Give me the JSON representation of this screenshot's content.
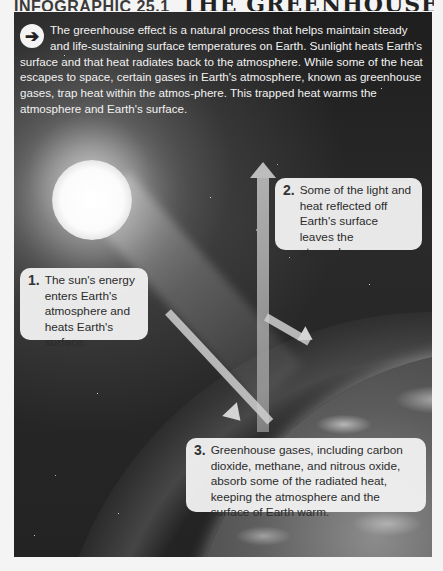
{
  "heading": {
    "label": "INFOGRAPHIC 25.1",
    "title": "THE GREENHOUSE EFFECT"
  },
  "intro": {
    "icon": "arrow-right-circle-icon",
    "text": "The greenhouse effect is a natural process that helps maintain steady and life-sustaining surface temperatures on Earth. Sunlight heats Earth's surface and that heat radiates back to the atmosphere. While some of the heat escapes to space, certain gases in Earth's atmosphere, known as greenhouse gases, trap heat within the atmos-phere. This trapped heat warms the atmosphere and Earth's surface."
  },
  "callouts": [
    {
      "number": "1.",
      "text": "The sun's energy enters Earth's atmosphere and heats Earth's surface."
    },
    {
      "number": "2.",
      "text": "Some of the light and heat reflected off Earth's surface leaves the atmosphere."
    },
    {
      "number": "3.",
      "text": "Greenhouse gases, including carbon dioxide, methane, and nitrous oxide, absorb some of the radiated heat, keeping the atmosphere and the surface of Earth warm."
    }
  ],
  "diagram": {
    "elements": [
      "sun",
      "incoming-sunlight-arrow",
      "reflected-heat-arrow-up",
      "reflected-heat-arrow-out",
      "atmosphere-layer",
      "earth"
    ],
    "colors": {
      "space": "#232323",
      "callout_bg": "#f0f0f0",
      "text_dark": "#2b2b2b",
      "text_light": "#f2f2f2",
      "page_bg": "#f4f4f4"
    }
  }
}
